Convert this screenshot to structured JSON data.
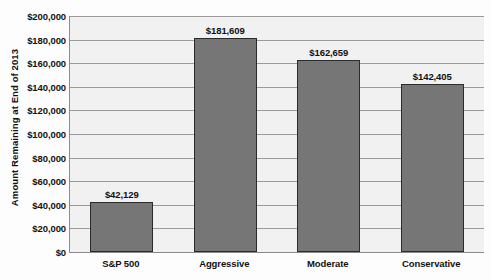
{
  "chart_data": {
    "type": "bar",
    "title": "on December 31, 2013, after a Year 2000 Retirement",
    "xlabel": "",
    "ylabel": "Amount Remaining at End of 2013",
    "categories": [
      "S&P 500",
      "Aggressive",
      "Moderate",
      "Conservative"
    ],
    "values": [
      42129,
      181609,
      162659,
      142405
    ],
    "value_labels": [
      "$42,129",
      "$181,609",
      "$162,659",
      "$142,405"
    ],
    "ylim": [
      0,
      200000
    ],
    "ytick_values": [
      0,
      20000,
      40000,
      60000,
      80000,
      100000,
      120000,
      140000,
      160000,
      180000,
      200000
    ],
    "ytick_labels": [
      "$0",
      "$20,000",
      "$40,000",
      "$60,000",
      "$80,000",
      "$100,000",
      "$120,000",
      "$140,000",
      "$160,000",
      "$180,000",
      "$200,000"
    ],
    "grid": true,
    "legend": false,
    "colors": {
      "bar_fill": "#767676",
      "bar_border": "#2b2b2b",
      "plot_background": "#f1f1f1",
      "gridline": "#9a9a9a",
      "axis_line": "#8b8b8b",
      "text": "#111111",
      "page_background": "#fdfdfd"
    }
  }
}
